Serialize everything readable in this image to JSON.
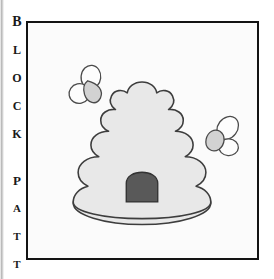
{
  "page": {
    "background_color": "#ffffff",
    "width": 274,
    "height": 279
  },
  "caption": {
    "name": "vertical-caption",
    "text": "BLOCK PATT",
    "letters": [
      {
        "char": "B",
        "top": 4,
        "size": 14,
        "weight": "bold"
      },
      {
        "char": "L",
        "top": 33,
        "size": 12,
        "weight": "bold"
      },
      {
        "char": "O",
        "top": 61,
        "size": 12,
        "weight": "bold"
      },
      {
        "char": "C",
        "top": 89,
        "size": 12,
        "weight": "bold"
      },
      {
        "char": "K",
        "top": 117,
        "size": 12,
        "weight": "bold"
      },
      {
        "char": "P",
        "top": 163,
        "size": 13,
        "weight": "bold"
      },
      {
        "char": "A",
        "top": 192,
        "size": 11,
        "weight": "bold"
      },
      {
        "char": "T",
        "top": 220,
        "size": 11,
        "weight": "bold"
      },
      {
        "char": "T",
        "top": 248,
        "size": 11,
        "weight": "bold"
      }
    ],
    "color": "#191919"
  },
  "frame": {
    "name": "illustration-frame",
    "border_color": "#131313",
    "border_width": 2,
    "fill_color": "#fbfbfb",
    "left": 26,
    "top": 21,
    "width": 233,
    "height": 239
  },
  "illustration": {
    "title": "beehive-with-bees",
    "style": "black-and-white line art clip art",
    "outline_color": "#3d3d3d",
    "colors": {
      "hive_fill": "#e8e8e8",
      "hive_outline": "#3d3d3d",
      "entrance_fill": "#595959",
      "entrance_outline": "#333333",
      "bee_wing_fill": "#fdfdfd",
      "bee_body_fill": "#d2d2d2",
      "bee_outline": "#444444"
    },
    "hive": {
      "name": "beehive",
      "tiers": 4,
      "description": "stacked scalloped dome tiers on a wide oval base",
      "entrance": {
        "name": "hive-entrance",
        "shape": "arched dome",
        "fill": "#595959"
      }
    },
    "bees": [
      {
        "name": "bee-left",
        "position": "upper-left of hive",
        "cx": 60,
        "cy": 65,
        "rotation": -15,
        "wings": 2,
        "body_fill": "#d2d2d2"
      },
      {
        "name": "bee-right",
        "position": "right of hive",
        "cx": 194,
        "cy": 116,
        "rotation": 20,
        "wings": 2,
        "body_fill": "#d2d2d2"
      }
    ]
  }
}
